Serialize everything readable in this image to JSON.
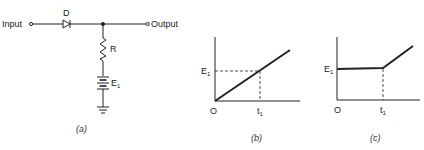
{
  "figure": {
    "panel_a": {
      "caption": "(a)",
      "input_label": "Input",
      "output_label": "Output",
      "diode_label": "D",
      "resistor_label": "R",
      "battery_label": "E",
      "battery_subscript": "1",
      "components": [
        "diode",
        "resistor",
        "battery",
        "ground"
      ]
    },
    "panel_b": {
      "caption": "(b)",
      "y_label": "E",
      "y_label_subscript": "1",
      "origin_label": "O",
      "x_label": "t",
      "x_label_subscript": "1",
      "description": "Ramp input rising linearly from origin, crossing E1 at t1"
    },
    "panel_c": {
      "caption": "(c)",
      "y_label": "E",
      "y_label_subscript": "1",
      "origin_label": "O",
      "x_label": "t",
      "x_label_subscript": "1",
      "description": "Output held at E1 until t1, then rises with ramp"
    }
  },
  "colors": {
    "stroke": "#222222",
    "background": "#ffffff"
  }
}
